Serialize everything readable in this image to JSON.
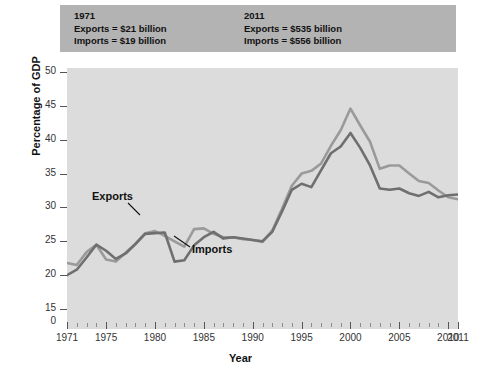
{
  "annotation": {
    "left": {
      "year": "1971",
      "exports": "Exports = $21 billion",
      "imports": "Imports = $19 billion"
    },
    "right": {
      "year": "2011",
      "exports": "Exports = $535 billion",
      "imports": "Imports = $556 billion"
    }
  },
  "colors": {
    "exports": "#9a9a9a",
    "imports": "#6f6f6f",
    "plot_background": "#dcdcdc",
    "annotation_background": "#b3b3b3",
    "axis": "#555555",
    "text": "#111111"
  },
  "chart_data": {
    "type": "line",
    "title": "",
    "xlabel": "Year",
    "ylabel": "Percentage of GDP",
    "xlim": [
      1971,
      2011
    ],
    "ylim": [
      15,
      50
    ],
    "y_axis_break": true,
    "y_axis_zero_label": "0",
    "grid": false,
    "legend_position": "inline-annotations",
    "y_ticks": [
      "50",
      "45",
      "40",
      "35",
      "30",
      "25",
      "20",
      "15",
      "0"
    ],
    "y_tick_values": [
      50,
      45,
      40,
      35,
      30,
      25,
      20,
      15
    ],
    "x_ticks": [
      "1971",
      "1975",
      "1980",
      "1985",
      "1990",
      "1995",
      "2000",
      "2005",
      "2010",
      "2011"
    ],
    "x_tick_values": [
      1971,
      1975,
      1980,
      1985,
      1990,
      1995,
      2000,
      2005,
      2010,
      2011
    ],
    "x": [
      1971,
      1972,
      1973,
      1974,
      1975,
      1976,
      1977,
      1978,
      1979,
      1980,
      1981,
      1982,
      1983,
      1984,
      1985,
      1986,
      1987,
      1988,
      1989,
      1990,
      1991,
      1992,
      1993,
      1994,
      1995,
      1996,
      1997,
      1998,
      1999,
      2000,
      2001,
      2002,
      2003,
      2004,
      2005,
      2006,
      2007,
      2008,
      2009,
      2010,
      2011
    ],
    "series": [
      {
        "name": "Exports",
        "color": "#9a9a9a",
        "values": [
          21.8,
          21.5,
          23.4,
          24.5,
          22.3,
          22.0,
          23.3,
          24.6,
          26.2,
          26.5,
          25.8,
          25.0,
          24.2,
          26.8,
          26.9,
          26.1,
          25.6,
          25.6,
          25.3,
          25.2,
          24.9,
          26.6,
          29.8,
          33.2,
          35.0,
          35.4,
          36.5,
          39.1,
          41.4,
          44.6,
          42.1,
          39.7,
          35.7,
          36.2,
          36.2,
          35.0,
          33.9,
          33.6,
          32.5,
          31.5,
          31.2
        ]
      },
      {
        "name": "Imports",
        "color": "#6f6f6f",
        "values": [
          20.0,
          20.8,
          22.6,
          24.5,
          23.6,
          22.4,
          23.2,
          24.6,
          26.1,
          26.2,
          26.3,
          22.0,
          22.2,
          24.4,
          25.6,
          26.4,
          25.4,
          25.6,
          25.4,
          25.2,
          25.0,
          26.4,
          29.4,
          32.6,
          33.5,
          33.0,
          35.5,
          38.0,
          39.0,
          41.0,
          38.8,
          36.2,
          32.8,
          32.6,
          32.8,
          32.1,
          31.7,
          32.3,
          31.5,
          31.8,
          31.9
        ]
      }
    ],
    "annotations": [
      {
        "text": "Exports",
        "x_px": 92,
        "y_px": 190
      },
      {
        "text": "Imports",
        "x_px": 192,
        "y_px": 243
      }
    ]
  }
}
